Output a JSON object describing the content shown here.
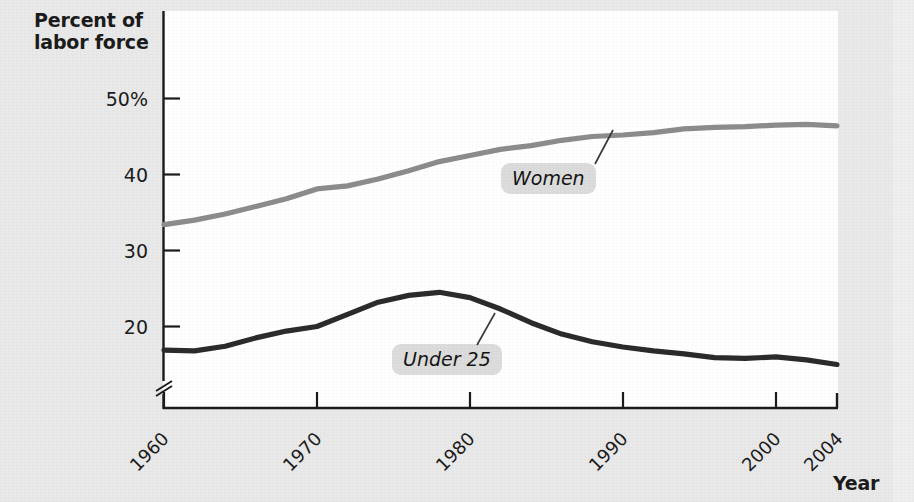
{
  "chart_data": {
    "type": "line",
    "title": "",
    "subtitle": "",
    "ylabel": "Percent of\nlabor force",
    "xlabel": "Year",
    "xlim": [
      1960,
      2004
    ],
    "ylim": [
      15,
      52.5
    ],
    "yaxis_break": true,
    "grid": false,
    "legend_position": "inline-annotations",
    "ytick_labels": [
      "50%",
      "40",
      "30",
      "20"
    ],
    "ytick_values": [
      50,
      40,
      30,
      20
    ],
    "xtick_labels": [
      "1960",
      "1970",
      "1980",
      "1990",
      "2000",
      "2004"
    ],
    "xtick_values": [
      1960,
      1970,
      1980,
      1990,
      2000,
      2004
    ],
    "series": [
      {
        "name": "Women",
        "color": "#8c8c8c",
        "x": [
          1960,
          1962,
          1964,
          1966,
          1968,
          1970,
          1972,
          1974,
          1976,
          1978,
          1980,
          1982,
          1984,
          1986,
          1988,
          1990,
          1992,
          1994,
          1996,
          1998,
          2000,
          2002,
          2004
        ],
        "values": [
          33.4,
          34.0,
          34.8,
          35.8,
          36.8,
          38.1,
          38.5,
          39.4,
          40.5,
          41.7,
          42.5,
          43.3,
          43.8,
          44.5,
          45.0,
          45.2,
          45.5,
          46.0,
          46.2,
          46.3,
          46.5,
          46.6,
          46.4
        ]
      },
      {
        "name": "Under 25",
        "color": "#2b2b2b",
        "x": [
          1960,
          1962,
          1964,
          1966,
          1968,
          1970,
          1972,
          1974,
          1976,
          1978,
          1980,
          1982,
          1984,
          1986,
          1988,
          1990,
          1992,
          1994,
          1996,
          1998,
          2000,
          2002,
          2004
        ],
        "values": [
          16.9,
          16.8,
          17.4,
          18.5,
          19.4,
          20.0,
          21.6,
          23.2,
          24.1,
          24.5,
          23.8,
          22.3,
          20.5,
          19.0,
          18.0,
          17.3,
          16.8,
          16.4,
          15.9,
          15.8,
          16.0,
          15.6,
          15.0
        ]
      }
    ],
    "annotations": [
      {
        "text": "Women",
        "x": 1985,
        "y": 40.5
      },
      {
        "text": "Under 25",
        "x": 1977,
        "y": 19.7
      }
    ]
  },
  "axis": {
    "y_title": "Percent of\nlabor force",
    "x_title": "Year"
  },
  "colors": {
    "background": "#e9e9e9",
    "plot_background": "#ffffff",
    "axis": "#1b1b1b",
    "women_line": "#8c8c8c",
    "under25_line": "#2b2b2b",
    "label_box": "#dcdcdc"
  }
}
